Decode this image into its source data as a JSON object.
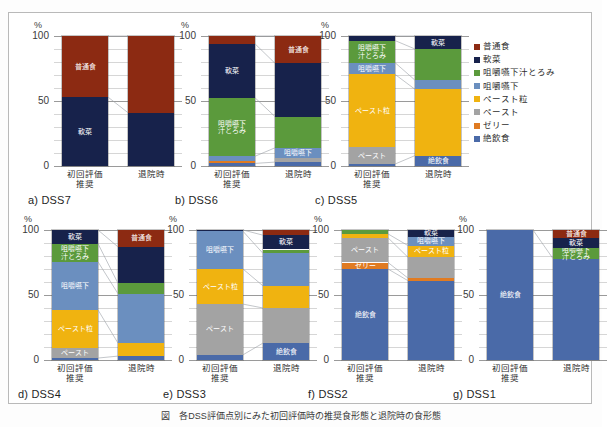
{
  "figure": {
    "y_axis_unit": "%",
    "y_ticks": [
      "100",
      "50",
      "0"
    ],
    "x_categories": [
      "初回評価\n推奨",
      "退院時"
    ],
    "x_category_1_line1": "初回評価",
    "x_category_1_line2": "推奨",
    "x_category_2": "退院時",
    "caption": "図　各DSS評価点別にみた初回評価時の推奨食形態と退院時の食形態"
  },
  "legend": {
    "position": "right-top",
    "items": [
      {
        "label": "普通食",
        "color": "#8c2a12"
      },
      {
        "label": "軟菜",
        "color": "#17224b"
      },
      {
        "label": "咀嚼嚥下汁とろみ",
        "color": "#5b9a3c"
      },
      {
        "label": "咀嚼嚥下",
        "color": "#6b8fbf"
      },
      {
        "label": "ペースト粒",
        "color": "#f0b310"
      },
      {
        "label": "ペースト",
        "color": "#a3a3a3"
      },
      {
        "label": "ゼリー",
        "color": "#e07b22"
      },
      {
        "label": "絶飲食",
        "color": "#4a6aa8"
      }
    ]
  },
  "chart_data": {
    "type": "bar",
    "subtype": "stacked-100-percent",
    "title": "図　各DSS評価点別にみた初回評価時の推奨食形態と退院時の食形態",
    "xlabel": "",
    "ylabel": "%",
    "ylim": [
      0,
      100
    ],
    "y_ticks": [
      0,
      50,
      100
    ],
    "grid": true,
    "categories": [
      "初回評価推奨",
      "退院時"
    ],
    "series_names": [
      "普通食",
      "軟菜",
      "咀嚼嚥下汁とろみ",
      "咀嚼嚥下",
      "ペースト粒",
      "ペースト",
      "ゼリー",
      "絶飲食"
    ],
    "panels": [
      {
        "id": "a",
        "title": "a) DSS7",
        "bars": [
          {
            "category": "初回評価推奨",
            "segments": [
              {
                "name": "軟菜",
                "value": 53,
                "label": "軟菜",
                "label_color": "#ffffff"
              },
              {
                "name": "普通食",
                "value": 47,
                "label": "普通食",
                "label_color": "#ffffff"
              }
            ]
          },
          {
            "category": "退院時",
            "segments": [
              {
                "name": "軟菜",
                "value": 41,
                "label": "",
                "label_color": "#ffffff"
              },
              {
                "name": "普通食",
                "value": 59,
                "label": "",
                "label_color": "#ffffff"
              }
            ]
          }
        ]
      },
      {
        "id": "b",
        "title": "b) DSS6",
        "bars": [
          {
            "category": "初回評価推奨",
            "segments": [
              {
                "name": "絶飲食",
                "value": 2,
                "label": "",
                "label_color": "#ffffff"
              },
              {
                "name": "ゼリー",
                "value": 1.5,
                "label": "",
                "label_color": "#ffffff"
              },
              {
                "name": "咀嚼嚥下",
                "value": 4,
                "label": "",
                "label_color": "#ffffff"
              },
              {
                "name": "咀嚼嚥下汁とろみ",
                "value": 45,
                "label": "咀嚼嚥下\n汁とろみ",
                "label_color": "#ffffff"
              },
              {
                "name": "軟菜",
                "value": 41.5,
                "label": "軟菜",
                "label_color": "#ffffff"
              },
              {
                "name": "普通食",
                "value": 6,
                "label": "",
                "label_color": "#ffffff"
              }
            ]
          },
          {
            "category": "退院時",
            "segments": [
              {
                "name": "絶飲食",
                "value": 3,
                "label": "",
                "label_color": "#ffffff"
              },
              {
                "name": "ペースト",
                "value": 3,
                "label": "",
                "label_color": "#ffffff"
              },
              {
                "name": "咀嚼嚥下",
                "value": 8,
                "label": "咀嚼嚥下",
                "label_color": "#ffffff"
              },
              {
                "name": "咀嚼嚥下汁とろみ",
                "value": 24,
                "label": "",
                "label_color": "#ffffff"
              },
              {
                "name": "軟菜",
                "value": 41,
                "label": "",
                "label_color": "#ffffff"
              },
              {
                "name": "普通食",
                "value": 21,
                "label": "普通食",
                "label_color": "#ffffff"
              }
            ]
          }
        ]
      },
      {
        "id": "c",
        "title": "c) DSS5",
        "bars": [
          {
            "category": "初回評価推奨",
            "segments": [
              {
                "name": "絶飲食",
                "value": 1.5,
                "label": "",
                "label_color": "#ffffff"
              },
              {
                "name": "ペースト",
                "value": 13,
                "label": "ペースト",
                "label_color": "#ffffff"
              },
              {
                "name": "ペースト粒",
                "value": 56,
                "label": "ペースト粒",
                "label_color": "#ffffff"
              },
              {
                "name": "咀嚼嚥下",
                "value": 9,
                "label": "咀嚼嚥下",
                "label_color": "#ffffff"
              },
              {
                "name": "咀嚼嚥下汁とろみ",
                "value": 17,
                "label": "咀嚼嚥下\n汁とろみ",
                "label_color": "#ffffff"
              },
              {
                "name": "軟菜",
                "value": 3.5,
                "label": "",
                "label_color": "#ffffff"
              }
            ]
          },
          {
            "category": "退院時",
            "segments": [
              {
                "name": "絶飲食",
                "value": 8,
                "label": "絶飲食",
                "label_color": "#ffffff"
              },
              {
                "name": "ペースト粒",
                "value": 51,
                "label": "",
                "label_color": "#ffffff"
              },
              {
                "name": "咀嚼嚥下",
                "value": 7,
                "label": "",
                "label_color": "#ffffff"
              },
              {
                "name": "咀嚼嚥下汁とろみ",
                "value": 24,
                "label": "",
                "label_color": "#ffffff"
              },
              {
                "name": "軟菜",
                "value": 10,
                "label": "軟菜",
                "label_color": "#ffffff"
              }
            ]
          }
        ]
      },
      {
        "id": "d",
        "title": "d) DSS4",
        "bars": [
          {
            "category": "初回評価推奨",
            "segments": [
              {
                "name": "絶飲食",
                "value": 1.5,
                "label": "",
                "label_color": "#ffffff"
              },
              {
                "name": "ペースト",
                "value": 8,
                "label": "ペースト",
                "label_color": "#ffffff"
              },
              {
                "name": "ペースト粒",
                "value": 29,
                "label": "ペースト粒",
                "label_color": "#ffffff"
              },
              {
                "name": "咀嚼嚥下",
                "value": 37,
                "label": "咀嚼嚥下",
                "label_color": "#ffffff"
              },
              {
                "name": "咀嚼嚥下汁とろみ",
                "value": 14,
                "label": "咀嚼嚥下\n汁とろみ",
                "label_color": "#ffffff"
              },
              {
                "name": "軟菜",
                "value": 10.5,
                "label": "軟菜",
                "label_color": "#ffffff"
              }
            ]
          },
          {
            "category": "退院時",
            "segments": [
              {
                "name": "絶飲食",
                "value": 3,
                "label": "",
                "label_color": "#ffffff"
              },
              {
                "name": "ペースト粒",
                "value": 10,
                "label": "",
                "label_color": "#ffffff"
              },
              {
                "name": "咀嚼嚥下",
                "value": 38,
                "label": "",
                "label_color": "#ffffff"
              },
              {
                "name": "咀嚼嚥下汁とろみ",
                "value": 8,
                "label": "",
                "label_color": "#ffffff"
              },
              {
                "name": "軟菜",
                "value": 28,
                "label": "",
                "label_color": "#ffffff"
              },
              {
                "name": "普通食",
                "value": 13,
                "label": "普通食",
                "label_color": "#ffffff"
              }
            ]
          }
        ]
      },
      {
        "id": "e",
        "title": "e) DSS3",
        "bars": [
          {
            "category": "初回評価推奨",
            "segments": [
              {
                "name": "絶飲食",
                "value": 4,
                "label": "",
                "label_color": "#ffffff"
              },
              {
                "name": "ペースト",
                "value": 39,
                "label": "ペースト",
                "label_color": "#ffffff"
              },
              {
                "name": "ペースト粒",
                "value": 27,
                "label": "ペースト粒",
                "label_color": "#ffffff"
              },
              {
                "name": "咀嚼嚥下",
                "value": 29,
                "label": "咀嚼嚥下",
                "label_color": "#ffffff"
              },
              {
                "name": "軟菜",
                "value": 1,
                "label": "",
                "label_color": "#ffffff"
              }
            ]
          },
          {
            "category": "退院時",
            "segments": [
              {
                "name": "絶飲食",
                "value": 13,
                "label": "絶飲食",
                "label_color": "#ffffff"
              },
              {
                "name": "ペースト",
                "value": 27,
                "label": "",
                "label_color": "#ffffff"
              },
              {
                "name": "ペースト粒",
                "value": 17,
                "label": "",
                "label_color": "#ffffff"
              },
              {
                "name": "咀嚼嚥下",
                "value": 25,
                "label": "",
                "label_color": "#ffffff"
              },
              {
                "name": "咀嚼嚥下汁とろみ",
                "value": 3,
                "label": "",
                "label_color": "#ffffff"
              },
              {
                "name": "軟菜",
                "value": 11,
                "label": "軟菜",
                "label_color": "#ffffff"
              },
              {
                "name": "普通食",
                "value": 4,
                "label": "",
                "label_color": "#ffffff"
              }
            ]
          }
        ]
      },
      {
        "id": "f",
        "title": "f) DSS2",
        "bars": [
          {
            "category": "初回評価推奨",
            "segments": [
              {
                "name": "絶飲食",
                "value": 70,
                "label": "絶飲食",
                "label_color": "#ffffff"
              },
              {
                "name": "ゼリー",
                "value": 5,
                "label": "ゼリー",
                "label_color": "#ffffff"
              },
              {
                "name": "ペースト",
                "value": 19,
                "label": "ペースト",
                "label_color": "#ffffff"
              },
              {
                "name": "ペースト粒",
                "value": 3,
                "label": "",
                "label_color": "#ffffff"
              },
              {
                "name": "咀嚼嚥下汁とろみ",
                "value": 3,
                "label": "",
                "label_color": "#ffffff"
              }
            ]
          },
          {
            "category": "退院時",
            "segments": [
              {
                "name": "絶飲食",
                "value": 61,
                "label": "",
                "label_color": "#ffffff"
              },
              {
                "name": "ゼリー",
                "value": 2,
                "label": "",
                "label_color": "#ffffff"
              },
              {
                "name": "ペースト",
                "value": 16,
                "label": "",
                "label_color": "#ffffff"
              },
              {
                "name": "ペースト粒",
                "value": 9,
                "label": "ペースト粒",
                "label_color": "#ffffff"
              },
              {
                "name": "咀嚼嚥下",
                "value": 7,
                "label": "咀嚼嚥下",
                "label_color": "#ffffff"
              },
              {
                "name": "軟菜",
                "value": 5,
                "label": "軟菜",
                "label_color": "#ffffff"
              }
            ]
          }
        ]
      },
      {
        "id": "g",
        "title": "g) DSS1",
        "bars": [
          {
            "category": "初回評価推奨",
            "segments": [
              {
                "name": "絶飲食",
                "value": 100,
                "label": "絶飲食",
                "label_color": "#ffffff"
              }
            ]
          },
          {
            "category": "退院時",
            "segments": [
              {
                "name": "絶飲食",
                "value": 78,
                "label": "",
                "label_color": "#ffffff"
              },
              {
                "name": "咀嚼嚥下汁とろみ",
                "value": 8,
                "label": "咀嚼嚥下\n汁とろみ",
                "label_color": "#ffffff"
              },
              {
                "name": "軟菜",
                "value": 8,
                "label": "軟菜",
                "label_color": "#ffffff"
              },
              {
                "name": "普通食",
                "value": 6,
                "label": "普通食",
                "label_color": "#ffffff"
              }
            ]
          }
        ]
      }
    ]
  }
}
